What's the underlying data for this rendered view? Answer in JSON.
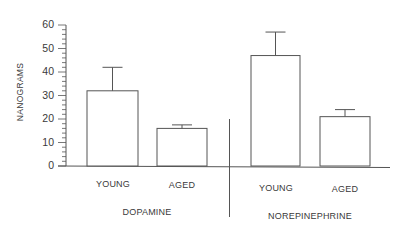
{
  "chart_data": {
    "type": "bar",
    "title": "",
    "xlabel": "",
    "ylabel": "NANOGRAMS",
    "ylim": [
      0,
      60
    ],
    "yticks": [
      0,
      10,
      20,
      30,
      40,
      50,
      60
    ],
    "minor_ticks_per_major": 5,
    "grid": false,
    "legend": null,
    "groups": [
      {
        "name": "DOPAMINE",
        "categories": [
          "YOUNG",
          "AGED"
        ],
        "values": [
          32,
          16
        ],
        "error_upper": [
          42,
          17.5
        ]
      },
      {
        "name": "NOREPINEPHRINE",
        "categories": [
          "YOUNG",
          "AGED"
        ],
        "values": [
          47,
          21
        ],
        "error_upper": [
          57,
          24
        ]
      }
    ],
    "categories": [
      "YOUNG",
      "AGED",
      "YOUNG",
      "AGED"
    ],
    "values": [
      32,
      16,
      47,
      21
    ],
    "error_bars": [
      10,
      1.5,
      10,
      3
    ],
    "bar_fill": "#ffffff",
    "line_color": "#555555"
  },
  "axis": {
    "ylabel": "NANOGRAMS",
    "ticks": [
      "0",
      "10",
      "20",
      "30",
      "40",
      "50",
      "60"
    ]
  },
  "labels": {
    "bars": [
      "YOUNG",
      "AGED",
      "YOUNG",
      "AGED"
    ],
    "groups": [
      "DOPAMINE",
      "NOREPINEPHRINE"
    ]
  }
}
